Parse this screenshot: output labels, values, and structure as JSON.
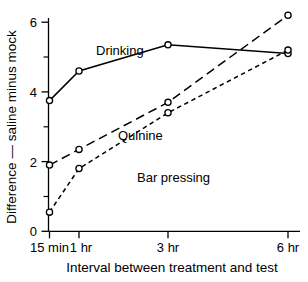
{
  "chart_data": {
    "type": "line",
    "title": "",
    "xlabel": "Interval between treatment and test",
    "ylabel": "Difference — saline minus mock",
    "categories": [
      "15 min",
      "1 hr",
      "3 hr",
      "6 hr"
    ],
    "category_positions": [
      0.25,
      1,
      3,
      6
    ],
    "xlim": [
      0,
      6.6
    ],
    "ylim": [
      0,
      6.5
    ],
    "yticks": [
      0,
      2,
      4,
      6
    ],
    "ytick_labels": [
      "0",
      "2",
      "4",
      "6"
    ],
    "yticks_minor": [
      1,
      3,
      5
    ],
    "grid": false,
    "legend_position": "inline-annotations",
    "marker": "open-circle",
    "series": [
      {
        "name": "Drinking",
        "linestyle": "solid",
        "values": [
          3.75,
          4.6,
          5.35,
          5.1
        ],
        "label_x": "1 hr",
        "label_y": 5.9
      },
      {
        "name": "Quinine",
        "linestyle": "long-dash",
        "values": [
          1.9,
          2.35,
          3.7,
          6.2
        ],
        "label_x": "3 hr",
        "label_y": 3.85
      },
      {
        "name": "Bar pressing",
        "linestyle": "short-dash",
        "values": [
          0.55,
          1.8,
          3.4,
          5.2
        ],
        "label_x": "3 hr",
        "label_y": 2.55
      }
    ],
    "annotations": [
      {
        "text": "Drinking",
        "series": "Drinking"
      },
      {
        "text": "Quinine",
        "series": "Quinine"
      },
      {
        "text": "Bar pressing",
        "series": "Bar pressing"
      }
    ]
  },
  "axes": {
    "y": {
      "label": "Difference — saline minus mock",
      "tick_labels": [
        "6",
        "4",
        "2",
        "0"
      ]
    },
    "x": {
      "label": "Interval between treatment and test",
      "tick_labels": [
        "15 min",
        "1 hr",
        "3 hr",
        "6 hr"
      ]
    }
  },
  "colors": {
    "ink": "#000000",
    "background": "#ffffff",
    "marker_fill": "#ffffff"
  }
}
